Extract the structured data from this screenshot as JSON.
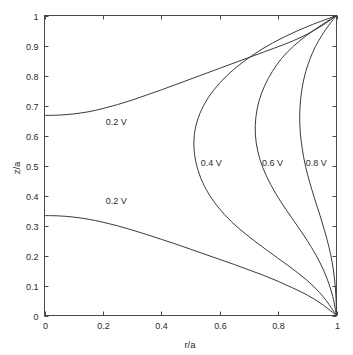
{
  "chart_data": {
    "type": "line",
    "title": "",
    "subtitle": "",
    "xlabel": "r/a",
    "ylabel": "z/a",
    "xlim": [
      0,
      1
    ],
    "ylim": [
      0,
      1
    ],
    "grid": false,
    "legend_position": "none",
    "legend_entries": [],
    "xticks": [
      0,
      0.2,
      0.4,
      0.6,
      0.8,
      1
    ],
    "xticklabels": [
      "0",
      "0.2",
      "0.4",
      "0.6",
      "0.8",
      "1"
    ],
    "yticks": [
      0,
      0.1,
      0.2,
      0.3,
      0.4,
      0.5,
      0.6,
      0.7,
      0.8,
      0.9,
      1
    ],
    "yticklabels": [
      "0",
      "0.1",
      "0.2",
      "0.3",
      "0.4",
      "0.5",
      "0.6",
      "0.7",
      "0.8",
      "0.9",
      "1"
    ],
    "series": [
      {
        "name": "0.2 V upper",
        "label": "0.2 V",
        "x": [
          0.0,
          0.05,
          0.1,
          0.15,
          0.2,
          0.25,
          0.3,
          0.35,
          0.4,
          0.45,
          0.5,
          0.55,
          0.6,
          0.65,
          0.7,
          0.75,
          0.8,
          0.85,
          0.9,
          0.95,
          1.0
        ],
        "y": [
          0.667,
          0.668,
          0.672,
          0.679,
          0.69,
          0.703,
          0.718,
          0.735,
          0.752,
          0.77,
          0.788,
          0.806,
          0.824,
          0.842,
          0.86,
          0.878,
          0.896,
          0.915,
          0.938,
          0.966,
          1.0
        ]
      },
      {
        "name": "0.2 V lower",
        "label": "0.2 V",
        "x": [
          0.0,
          0.05,
          0.1,
          0.15,
          0.2,
          0.25,
          0.3,
          0.35,
          0.4,
          0.45,
          0.5,
          0.55,
          0.6,
          0.65,
          0.7,
          0.75,
          0.8,
          0.85,
          0.9,
          0.95,
          1.0
        ],
        "y": [
          0.333,
          0.332,
          0.328,
          0.321,
          0.311,
          0.299,
          0.285,
          0.27,
          0.254,
          0.238,
          0.221,
          0.204,
          0.187,
          0.17,
          0.152,
          0.134,
          0.114,
          0.092,
          0.068,
          0.038,
          0.0
        ]
      },
      {
        "name": "0.4 V",
        "label": "0.4 V",
        "x": [
          1.0,
          0.905,
          0.82,
          0.745,
          0.68,
          0.625,
          0.58,
          0.545,
          0.522,
          0.512,
          0.515,
          0.53,
          0.556,
          0.594,
          0.642,
          0.7,
          0.764,
          0.832,
          0.898,
          0.955,
          1.0
        ],
        "y": [
          1.0,
          0.965,
          0.928,
          0.888,
          0.845,
          0.8,
          0.752,
          0.7,
          0.645,
          0.588,
          0.53,
          0.472,
          0.416,
          0.362,
          0.311,
          0.263,
          0.216,
          0.168,
          0.118,
          0.062,
          0.0
        ]
      },
      {
        "name": "0.6 V",
        "label": "0.6 V",
        "x": [
          1.0,
          0.948,
          0.898,
          0.852,
          0.812,
          0.78,
          0.754,
          0.735,
          0.724,
          0.722,
          0.73,
          0.748,
          0.775,
          0.808,
          0.845,
          0.882,
          0.915,
          0.944,
          0.968,
          0.987,
          1.0
        ],
        "y": [
          1.0,
          0.968,
          0.934,
          0.897,
          0.857,
          0.813,
          0.766,
          0.716,
          0.662,
          0.606,
          0.549,
          0.492,
          0.436,
          0.381,
          0.328,
          0.276,
          0.226,
          0.175,
          0.122,
          0.064,
          0.0
        ]
      },
      {
        "name": "0.8 V",
        "label": "0.8 V",
        "x": [
          1.0,
          0.974,
          0.95,
          0.928,
          0.91,
          0.895,
          0.884,
          0.877,
          0.874,
          0.876,
          0.883,
          0.894,
          0.909,
          0.926,
          0.944,
          0.96,
          0.974,
          0.985,
          0.993,
          0.998,
          1.0
        ],
        "y": [
          1.0,
          0.968,
          0.934,
          0.897,
          0.857,
          0.814,
          0.768,
          0.719,
          0.666,
          0.611,
          0.554,
          0.497,
          0.441,
          0.386,
          0.332,
          0.28,
          0.229,
          0.178,
          0.124,
          0.065,
          0.0
        ]
      }
    ],
    "annotations": [
      {
        "text": "0.2 V",
        "x": 0.21,
        "y": 0.635
      },
      {
        "text": "0.2 V",
        "x": 0.21,
        "y": 0.372
      },
      {
        "text": "0.4 V",
        "x": 0.535,
        "y": 0.497
      },
      {
        "text": "0.6 V",
        "x": 0.745,
        "y": 0.497
      },
      {
        "text": "0.8 V",
        "x": 0.895,
        "y": 0.497
      }
    ]
  },
  "axis": {
    "x_title": "r/a",
    "y_title": "z/a"
  }
}
